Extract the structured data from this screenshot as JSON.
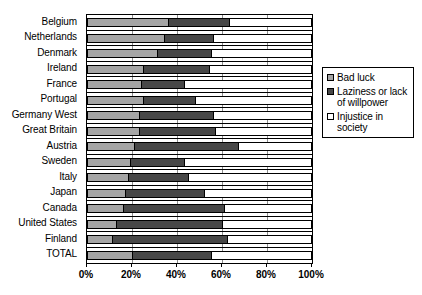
{
  "chart_data": {
    "type": "bar",
    "orientation": "horizontal",
    "stacked": true,
    "stack_mode": "percent",
    "title": "",
    "xlabel": "",
    "ylabel": "",
    "xlim": [
      0,
      100
    ],
    "grid": true,
    "legend_position": "right",
    "xticks": [
      "0%",
      "20%",
      "40%",
      "60%",
      "80%",
      "100%"
    ],
    "xtick_values": [
      0,
      20,
      40,
      60,
      80,
      100
    ],
    "categories": [
      "Belgium",
      "Netherlands",
      "Denmark",
      "Ireland",
      "France",
      "Portugal",
      "Germany West",
      "Great Britain",
      "Austria",
      "Sweden",
      "Italy",
      "Japan",
      "Canada",
      "United States",
      "Finland",
      "TOTAL"
    ],
    "series": [
      {
        "name": "Bad luck",
        "color": "#a5a5a5",
        "values": [
          36,
          34,
          31,
          25,
          24,
          25,
          23,
          23,
          21,
          19,
          18,
          17,
          16,
          13,
          11,
          20
        ]
      },
      {
        "name": "Laziness or lack of willpower",
        "color": "#474747",
        "values": [
          27,
          22,
          24,
          29,
          19,
          23,
          33,
          34,
          46,
          24,
          27,
          35,
          45,
          47,
          51,
          35
        ]
      },
      {
        "name": "Injustice in society",
        "color": "#ffffff",
        "values": [
          37,
          44,
          45,
          46,
          57,
          52,
          44,
          43,
          33,
          57,
          55,
          48,
          39,
          40,
          38,
          45
        ]
      }
    ]
  },
  "legend": {
    "items": [
      {
        "label": "Bad luck",
        "swatch": "badluck-swatch"
      },
      {
        "label": "Laziness or lack of willpower",
        "swatch": "laziness-swatch"
      },
      {
        "label": "Injustice in society",
        "swatch": "injustice-swatch"
      }
    ]
  }
}
